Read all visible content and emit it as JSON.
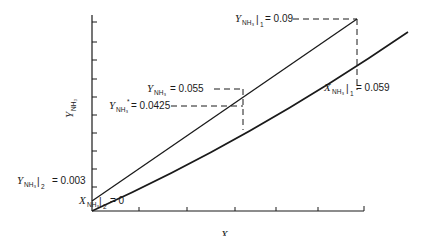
{
  "diagram": {
    "type": "absorption operating line vs equilibrium curve",
    "x_axis": {
      "symbol": "X",
      "subscript": "NH₃",
      "label": "X_NH3"
    },
    "y_axis": {
      "symbol": "Y",
      "subscript": "NH₃",
      "label": "Y_NH3"
    },
    "lines": [
      {
        "name": "operating-line",
        "from": [
          0,
          0.003
        ],
        "to": [
          0.059,
          0.09
        ]
      },
      {
        "name": "equilibrium-curve",
        "shape": "slightly concave"
      }
    ],
    "annotations": {
      "top": {
        "symbol": "Y",
        "sub": "NH₃",
        "bar_sub": "1",
        "value": "= 0.09"
      },
      "right": {
        "symbol": "X",
        "sub": "NH₃",
        "bar_sub": "1",
        "value": "= 0.059"
      },
      "mid_op": {
        "symbol": "Y",
        "sub": "NH₃",
        "value": "= 0.055"
      },
      "mid_eq": {
        "symbol": "Y",
        "sub": "NH₃",
        "sup": "*",
        "value": "= 0.0425"
      },
      "origin_y": {
        "symbol": "Y",
        "sub": "NH₃",
        "bar_sub": "2",
        "value": "= 0.003"
      },
      "origin_x": {
        "symbol": "X",
        "sub": "NH₃",
        "bar_sub": "2",
        "value": "= 0"
      }
    },
    "axis_titles": {
      "x": {
        "symbol": "X",
        "sub": "NH₃"
      },
      "y": {
        "symbol": "Y",
        "sub": "NH₃"
      }
    }
  }
}
